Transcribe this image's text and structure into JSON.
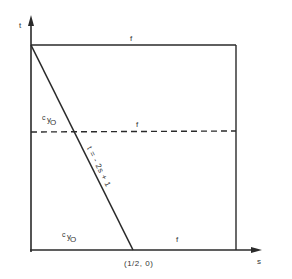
{
  "diagram": {
    "axes": {
      "vertical_label": "t",
      "horizontal_label": "s"
    },
    "regions": {
      "top_label": "f",
      "middle_label": "f",
      "bottom_label": "f"
    },
    "constraint_labels": {
      "upper": {
        "c": "c",
        "y": "y",
        "o": "O"
      },
      "lower": {
        "c": "c",
        "y": "y",
        "o": "O"
      }
    },
    "line_equation": "t = - 2s + 1",
    "point_label": "(1/2, 0)",
    "colors": {
      "stroke": "#2a2a2a",
      "background": "#ffffff"
    }
  }
}
